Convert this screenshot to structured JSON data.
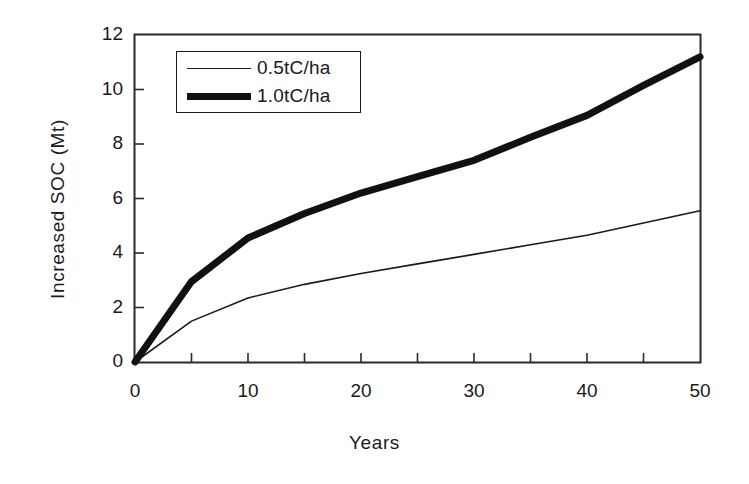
{
  "chart_data": {
    "type": "line",
    "title": "",
    "xlabel": "Years",
    "ylabel": "Increased SOC (Mt)",
    "xlim": [
      0,
      50
    ],
    "ylim": [
      0,
      12
    ],
    "x_ticks": [
      0,
      10,
      20,
      30,
      40,
      50
    ],
    "x_minor_ticks": [
      5,
      15,
      25,
      35,
      45
    ],
    "y_ticks": [
      0,
      2,
      4,
      6,
      8,
      10,
      12
    ],
    "grid": false,
    "legend_position": "upper left",
    "x": [
      0,
      5,
      10,
      15,
      20,
      25,
      30,
      35,
      40,
      45,
      50
    ],
    "series": [
      {
        "name": "0.5tC/ha",
        "style": "thin",
        "color": "#1a1a1a",
        "line_width": 1.6,
        "values": [
          0,
          1.5,
          2.35,
          2.85,
          3.25,
          3.6,
          3.95,
          4.3,
          4.65,
          5.1,
          5.55
        ]
      },
      {
        "name": "1.0tC/ha",
        "style": "thick",
        "color": "#111111",
        "line_width": 7,
        "values": [
          0,
          2.95,
          4.55,
          5.45,
          6.2,
          6.8,
          7.4,
          8.25,
          9.05,
          10.15,
          11.2
        ]
      }
    ]
  },
  "axes": {
    "y_tick_labels": [
      "12",
      "10",
      "8",
      "6",
      "4",
      "2",
      "0"
    ],
    "x_tick_labels": [
      "0",
      "10",
      "20",
      "30",
      "40",
      "50"
    ],
    "y_title": "Increased SOC (Mt)",
    "x_title": "Years"
  },
  "legend": {
    "items": [
      {
        "label": "0.5tC/ha"
      },
      {
        "label": "1.0tC/ha"
      }
    ]
  },
  "colors": {
    "axis": "#1a1a1a",
    "background": "#ffffff",
    "series_thin": "#1a1a1a",
    "series_thick": "#111111"
  }
}
